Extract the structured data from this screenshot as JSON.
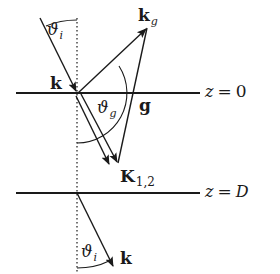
{
  "diagram": {
    "type": "scattering-geometry",
    "colors": {
      "ink": "#1a1a1a",
      "background": "#ffffff"
    },
    "surfaces": [
      {
        "label": "z = 0",
        "z_text": "z",
        "eq_text": "=",
        "value_text": "0"
      },
      {
        "label": "z = D",
        "z_text": "z",
        "eq_text": "=",
        "value_text": "D"
      }
    ],
    "vectors": {
      "incident": {
        "symbol": "k"
      },
      "diffracted": {
        "symbol": "k",
        "subscript": "g"
      },
      "internal": {
        "symbol": "K",
        "subscript": "1,2"
      },
      "reciprocal": {
        "symbol": "g"
      },
      "transmitted": {
        "symbol": "k"
      }
    },
    "angles": {
      "incidence_top": {
        "symbol": "ϑ",
        "subscript": "i"
      },
      "diffraction": {
        "symbol": "ϑ",
        "subscript": "g"
      },
      "incidence_bottom": {
        "symbol": "ϑ",
        "subscript": "i"
      }
    }
  }
}
